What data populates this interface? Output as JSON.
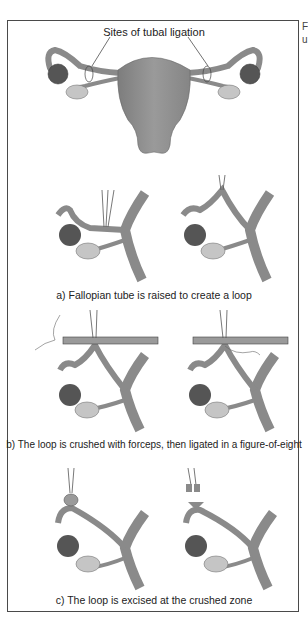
{
  "figure": {
    "top_label": "Sites of tubal ligation",
    "steps": [
      {
        "id": "a",
        "caption": "a) Fallopian tube is raised to create a loop"
      },
      {
        "id": "b",
        "caption": "b) The loop is crushed with forceps, then ligated in a figure-of-eight"
      },
      {
        "id": "c",
        "caption": "c) The loop is excised at the crushed zone"
      }
    ],
    "side_text_fragments": [
      "F",
      "u"
    ],
    "colors": {
      "tissue": "#8a8a8a",
      "tissue_light": "#b5b5b5",
      "ovary": "#c8c8c8",
      "fimbria": "#555555",
      "frame": "#4a4a4a",
      "text": "#222222"
    }
  }
}
